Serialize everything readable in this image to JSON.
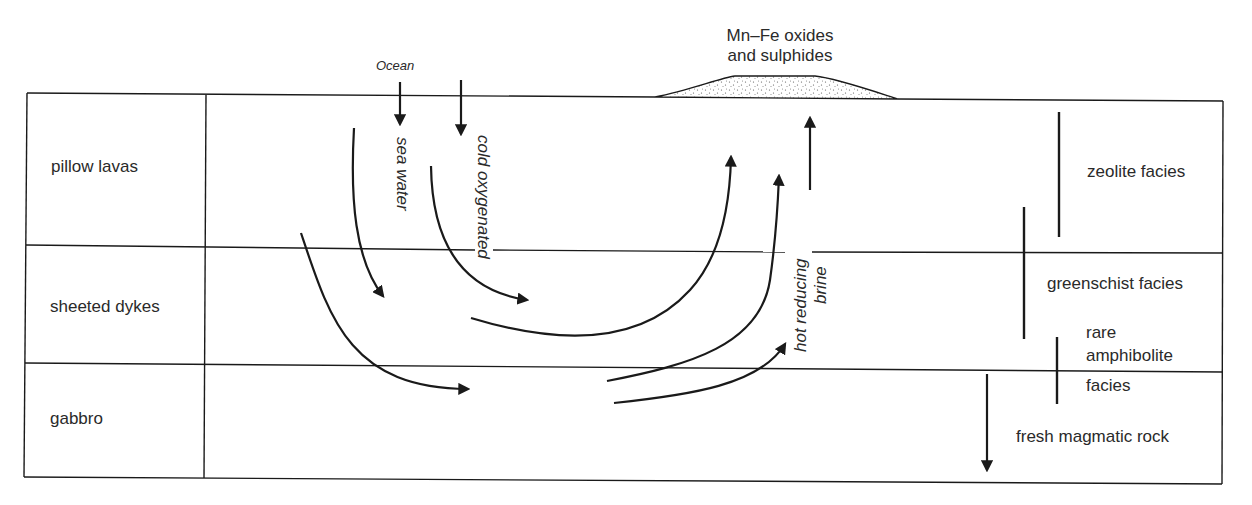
{
  "diagram": {
    "ocean_label": "Ocean",
    "deposit_label_line1": "Mn–Fe oxides",
    "deposit_label_line2": "and sulphides",
    "layers": [
      {
        "label": "pillow lavas"
      },
      {
        "label": "sheeted dykes"
      },
      {
        "label": "gabbro"
      }
    ],
    "flow_labels": {
      "sea_water": "sea water",
      "cold_oxygenated": "cold oxygenated",
      "hot_reducing": "hot reducing",
      "brine": "brine"
    },
    "facies": {
      "zeolite": "zeolite facies",
      "greenschist": "greenschist facies",
      "amphibolite_line1": "rare",
      "amphibolite_line2": "amphibolite",
      "amphibolite_line3": "facies",
      "fresh": "fresh magmatic rock"
    },
    "colors": {
      "ink": "#1a1a1a",
      "text": "#2a2a2a",
      "background": "#ffffff",
      "deposit_fill": "#efefef"
    }
  }
}
